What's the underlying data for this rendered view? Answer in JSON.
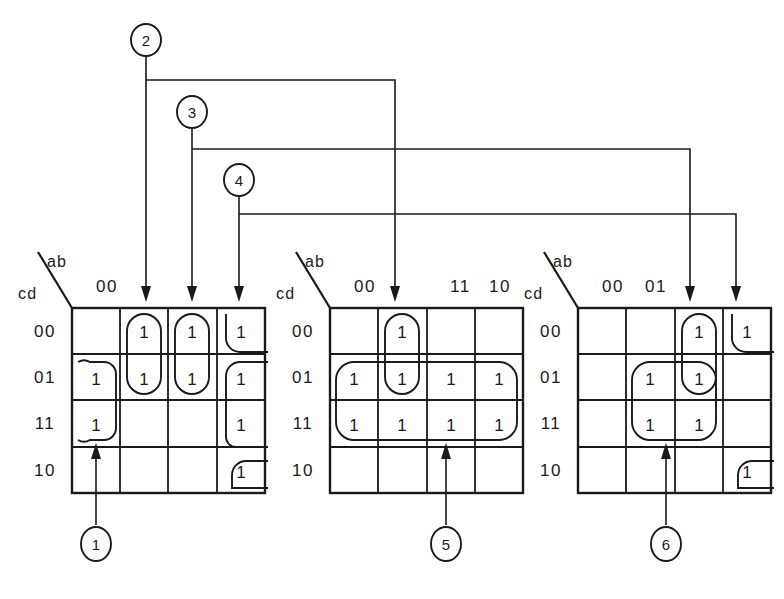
{
  "figure": {
    "background_color": "#ffffff",
    "ink_color": "#1a1a1a"
  },
  "axis_labels": {
    "column_var": "ab",
    "row_var": "cd"
  },
  "row_headers": [
    "00",
    "01",
    "11",
    "10"
  ],
  "cell_value": "1",
  "maps": [
    {
      "id": "kmap-1",
      "column_headers": [
        "00",
        "",
        "",
        ""
      ],
      "cells": [
        [
          "",
          "1",
          "1",
          "1"
        ],
        [
          "1",
          "1",
          "1",
          "1"
        ],
        [
          "1",
          "",
          "",
          "1"
        ],
        [
          "",
          "",
          "",
          "1"
        ]
      ],
      "groups": [
        {
          "name": "group-col2-rows00-01",
          "cols": [
            2,
            2
          ],
          "rows": [
            1,
            2
          ],
          "shape": "oval"
        },
        {
          "name": "group-col3-rows00-01",
          "cols": [
            3,
            3
          ],
          "rows": [
            1,
            2
          ],
          "shape": "oval"
        },
        {
          "name": "group-col4-rows00-01",
          "cols": [
            4,
            4
          ],
          "rows": [
            1,
            2
          ],
          "shape": "wrap"
        },
        {
          "name": "group-col1-rows01-11",
          "cols": [
            1,
            1
          ],
          "rows": [
            2,
            3
          ],
          "shape": "wrap"
        },
        {
          "name": "group-col4-rows01-11",
          "cols": [
            4,
            4
          ],
          "rows": [
            2,
            3
          ],
          "shape": "wrap"
        },
        {
          "name": "group-col4-row10",
          "cols": [
            4,
            4
          ],
          "rows": [
            4,
            4
          ],
          "shape": "wrap"
        }
      ]
    },
    {
      "id": "kmap-2",
      "column_headers": [
        "00",
        "",
        "11",
        "10"
      ],
      "cells": [
        [
          "",
          "1",
          "",
          ""
        ],
        [
          "1",
          "1",
          "1",
          "1"
        ],
        [
          "1",
          "1",
          "1",
          "1"
        ],
        [
          "",
          "",
          "",
          ""
        ]
      ],
      "groups": [
        {
          "name": "group-col2-rows00-01",
          "cols": [
            2,
            2
          ],
          "rows": [
            1,
            2
          ],
          "shape": "oval"
        },
        {
          "name": "group-all-rows01-11",
          "cols": [
            1,
            4
          ],
          "rows": [
            2,
            3
          ],
          "shape": "rect"
        }
      ]
    },
    {
      "id": "kmap-3",
      "column_headers": [
        "00",
        "01",
        "",
        ""
      ],
      "cells": [
        [
          "",
          "",
          "1",
          "1"
        ],
        [
          "",
          "1",
          "1",
          ""
        ],
        [
          "",
          "1",
          "1",
          ""
        ],
        [
          "",
          "",
          "",
          "1"
        ]
      ],
      "groups": [
        {
          "name": "group-col3-rows00-01",
          "cols": [
            3,
            3
          ],
          "rows": [
            1,
            2
          ],
          "shape": "oval"
        },
        {
          "name": "group-col4-row00",
          "cols": [
            4,
            4
          ],
          "rows": [
            1,
            1
          ],
          "shape": "wrap"
        },
        {
          "name": "group-cols2-3-rows01-11",
          "cols": [
            2,
            3
          ],
          "rows": [
            2,
            3
          ],
          "shape": "rect"
        },
        {
          "name": "group-col4-row10",
          "cols": [
            4,
            4
          ],
          "rows": [
            4,
            4
          ],
          "shape": "wrap"
        }
      ]
    }
  ],
  "callouts": [
    {
      "id": "callout-1",
      "label": "1",
      "position": "bottom",
      "target_map": 1,
      "target_col": 1
    },
    {
      "id": "callout-2",
      "label": "2",
      "position": "top",
      "target_map": 1,
      "target_col": 2
    },
    {
      "id": "callout-3",
      "label": "3",
      "position": "top",
      "target_map": 1,
      "target_col": 3
    },
    {
      "id": "callout-4",
      "label": "4",
      "position": "top",
      "target_map": 1,
      "target_col": 4
    },
    {
      "id": "callout-5",
      "label": "5",
      "position": "bottom",
      "target_map": 2,
      "target_col": 3
    },
    {
      "id": "callout-6",
      "label": "6",
      "position": "bottom",
      "target_map": 3,
      "target_col": 2
    }
  ]
}
